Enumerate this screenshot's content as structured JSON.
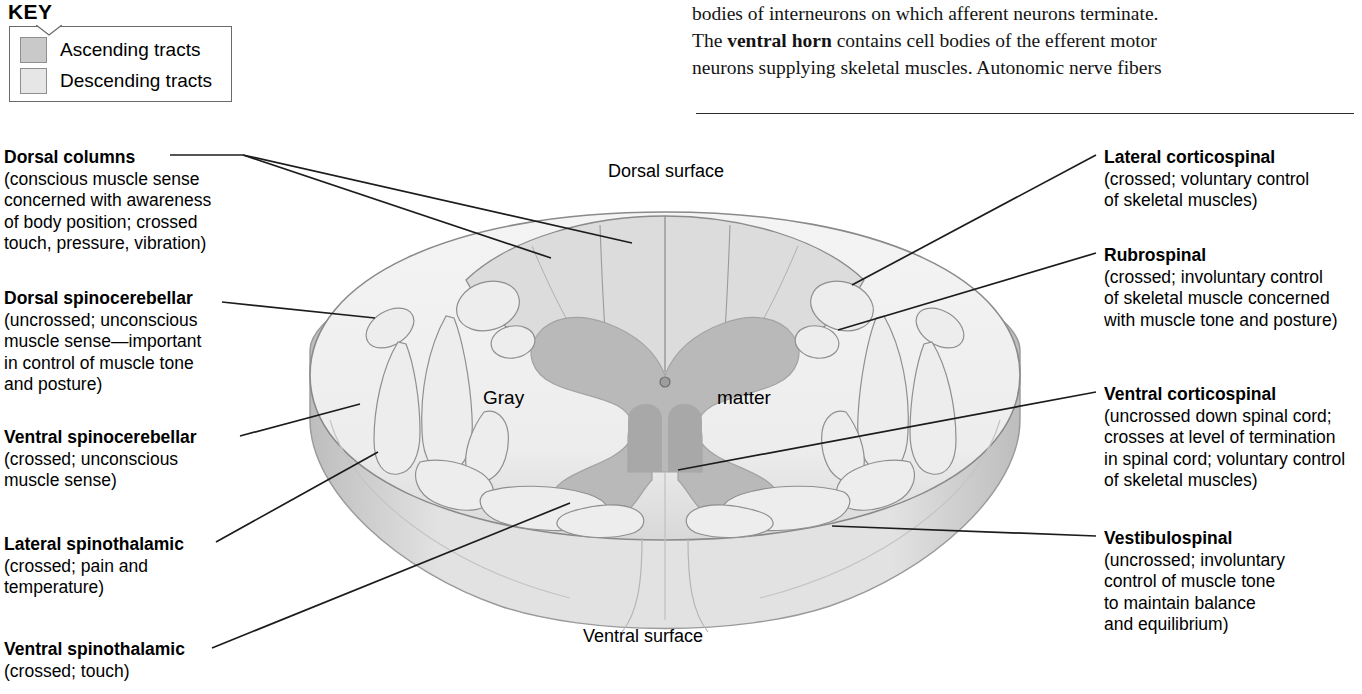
{
  "book_text": {
    "lines": [
      {
        "segments": [
          {
            "t": "bodies of interneurons on which afferent neurons terminate.",
            "b": false
          }
        ]
      },
      {
        "segments": [
          {
            "t": "The ",
            "b": false
          },
          {
            "t": "ventral horn",
            "b": true
          },
          {
            "t": " contains cell bodies of the efferent motor",
            "b": false
          }
        ]
      },
      {
        "segments": [
          {
            "t": "neurons supplying skeletal muscles. Autonomic nerve fibers",
            "b": false
          }
        ]
      }
    ]
  },
  "key": {
    "title": "KEY",
    "items": [
      {
        "label": "Ascending tracts",
        "color": "#c9c9c9"
      },
      {
        "label": "Descending tracts",
        "color": "#e6e6e6"
      }
    ]
  },
  "diagram": {
    "dorsal_surface_label": "Dorsal surface",
    "ventral_surface_label": "Ventral surface",
    "gray_label": "Gray",
    "matter_label": "matter",
    "colors": {
      "white_matter": "#f0f0f0",
      "gray_matter": "#b9b9b9",
      "ascending_tract": "#c9c9c9",
      "descending_tract": "#ededed",
      "outline": "#8a8a8a",
      "shadow": "#bdbdbd",
      "leader": "#1c1c1c"
    }
  },
  "left_labels": [
    {
      "heading": "Dorsal columns",
      "detail": [
        "(conscious muscle sense",
        "concerned with awareness",
        "of body position; crossed",
        "touch, pressure, vibration)"
      ]
    },
    {
      "heading": "Dorsal spinocerebellar",
      "detail": [
        "(uncrossed; unconscious",
        "muscle sense—important",
        "in control of muscle tone",
        "and posture)"
      ]
    },
    {
      "heading": "Ventral spinocerebellar",
      "detail": [
        "(crossed; unconscious",
        "muscle sense)"
      ]
    },
    {
      "heading": "Lateral spinothalamic",
      "detail": [
        "(crossed; pain and",
        "temperature)"
      ]
    },
    {
      "heading": "Ventral spinothalamic",
      "detail": [
        "(crossed; touch)"
      ]
    }
  ],
  "right_labels": [
    {
      "heading": "Lateral corticospinal",
      "detail": [
        "(crossed; voluntary control",
        "of skeletal muscles)"
      ]
    },
    {
      "heading": "Rubrospinal",
      "detail": [
        "(crossed; involuntary control",
        "of skeletal muscle concerned",
        "with muscle tone and posture)"
      ]
    },
    {
      "heading": "Ventral corticospinal",
      "detail": [
        "(uncrossed down spinal cord;",
        "crosses at level of termination",
        "in spinal cord; voluntary control",
        "of skeletal muscles)"
      ]
    },
    {
      "heading": "Vestibulospinal",
      "detail": [
        "(uncrossed; involuntary",
        "control of muscle tone",
        "to maintain balance",
        "and equilibrium)"
      ]
    }
  ]
}
